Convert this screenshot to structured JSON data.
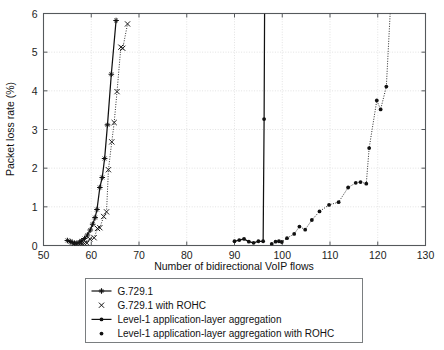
{
  "chart_data": {
    "type": "line",
    "title": "",
    "xlabel": "Number of bidirectional VoIP flows",
    "ylabel": "Packet loss rate (%)",
    "xlim": [
      50,
      130
    ],
    "ylim": [
      0,
      6
    ],
    "xticks": [
      50,
      60,
      70,
      80,
      90,
      100,
      110,
      120,
      130
    ],
    "yticks": [
      0,
      1,
      2,
      3,
      4,
      5,
      6
    ],
    "grid": true,
    "legend_position": "below-axes",
    "series": [
      {
        "name": "G.729.1",
        "marker": "plus-star",
        "line": "solid",
        "color": "#111111",
        "points": [
          [
            55.0,
            0.13
          ],
          [
            55.6,
            0.1
          ],
          [
            56.0,
            0.08
          ],
          [
            56.5,
            0.06
          ],
          [
            57.0,
            0.06
          ],
          [
            57.6,
            0.09
          ],
          [
            58.0,
            0.12
          ],
          [
            58.6,
            0.18
          ],
          [
            59.2,
            0.27
          ],
          [
            59.8,
            0.4
          ],
          [
            60.3,
            0.55
          ],
          [
            60.8,
            0.72
          ],
          [
            61.2,
            0.93
          ],
          [
            61.8,
            1.5
          ],
          [
            62.3,
            1.76
          ],
          [
            62.8,
            2.25
          ],
          [
            63.4,
            3.12
          ],
          [
            64.2,
            4.43
          ],
          [
            65.2,
            5.82
          ]
        ]
      },
      {
        "name": "G.729.1 with ROHC",
        "marker": "x",
        "line": "dotted",
        "color": "#1a1a1a",
        "points": [
          [
            56.3,
            0.03
          ],
          [
            57.0,
            0.03
          ],
          [
            57.6,
            0.03
          ],
          [
            58.1,
            0.04
          ],
          [
            58.6,
            0.05
          ],
          [
            59.1,
            0.06
          ],
          [
            59.7,
            0.17
          ],
          [
            60.6,
            0.2
          ],
          [
            61.3,
            0.44
          ],
          [
            61.8,
            0.46
          ],
          [
            62.6,
            0.75
          ],
          [
            63.2,
            0.87
          ],
          [
            63.6,
            1.96
          ],
          [
            64.3,
            2.68
          ],
          [
            64.8,
            3.18
          ],
          [
            65.4,
            3.98
          ],
          [
            66.2,
            5.13
          ],
          [
            66.6,
            5.1
          ],
          [
            67.6,
            5.73
          ]
        ]
      },
      {
        "name": "Level-1 application-layer aggregation",
        "marker": "dot",
        "line": "solid",
        "color": "#111111",
        "points": [
          [
            90.0,
            0.11
          ],
          [
            91.0,
            0.14
          ],
          [
            92.0,
            0.17
          ],
          [
            93.0,
            0.1
          ],
          [
            94.0,
            0.07
          ],
          [
            95.0,
            0.11
          ],
          [
            96.0,
            0.11
          ],
          [
            96.2,
            3.27
          ],
          [
            96.3,
            6.0
          ]
        ]
      },
      {
        "name": "Level-1 application-layer aggregation with ROHC",
        "marker": "dot",
        "line": "dotted",
        "color": "#111111",
        "points": [
          [
            97.8,
            0.04
          ],
          [
            98.6,
            0.1
          ],
          [
            99.3,
            0.11
          ],
          [
            99.9,
            0.09
          ],
          [
            101.0,
            0.19
          ],
          [
            102.5,
            0.3
          ],
          [
            103.6,
            0.49
          ],
          [
            104.8,
            0.41
          ],
          [
            106.2,
            0.66
          ],
          [
            107.8,
            0.88
          ],
          [
            109.8,
            1.05
          ],
          [
            111.8,
            1.12
          ],
          [
            113.8,
            1.5
          ],
          [
            115.4,
            1.62
          ],
          [
            116.4,
            1.64
          ],
          [
            117.6,
            1.6
          ],
          [
            118.2,
            2.52
          ],
          [
            119.8,
            3.75
          ],
          [
            120.6,
            3.52
          ],
          [
            121.8,
            4.11
          ],
          [
            122.6,
            6.0
          ]
        ]
      }
    ]
  },
  "legend": {
    "items": [
      {
        "label": "G.729.1",
        "marker": "line-plus-star"
      },
      {
        "label": "G.729.1 with ROHC",
        "marker": "x-only"
      },
      {
        "label": "Level-1 application-layer aggregation",
        "marker": "line-dot"
      },
      {
        "label": "Level-1 application-layer aggregation with ROHC",
        "marker": "dot-only"
      }
    ]
  },
  "colors": {
    "axis": "#55595c",
    "grid": "#e2e2e2",
    "ink": "#111111",
    "legend_border": "#7a7e80"
  }
}
